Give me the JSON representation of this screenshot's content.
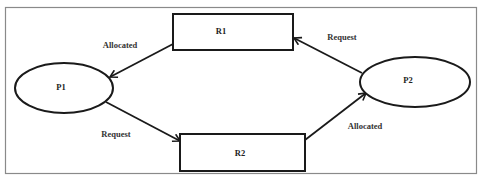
{
  "diagram": {
    "type": "resource-allocation-graph",
    "processes": [
      {
        "id": "P1",
        "label": "P1"
      },
      {
        "id": "P2",
        "label": "P2"
      }
    ],
    "resources": [
      {
        "id": "R1",
        "label": "R1"
      },
      {
        "id": "R2",
        "label": "R2"
      }
    ],
    "edges": [
      {
        "id": "r1-p1",
        "from": "R1",
        "to": "P1",
        "label": "Allocated"
      },
      {
        "id": "p2-r1",
        "from": "P2",
        "to": "R1",
        "label": "Request"
      },
      {
        "id": "p1-r2",
        "from": "P1",
        "to": "R2",
        "label": "Request"
      },
      {
        "id": "r2-p2",
        "from": "R2",
        "to": "P2",
        "label": "Allocated"
      }
    ],
    "colors": {
      "stroke": "#1a1a1a",
      "frame": "#8a8a8a",
      "background": "#ffffff"
    }
  }
}
